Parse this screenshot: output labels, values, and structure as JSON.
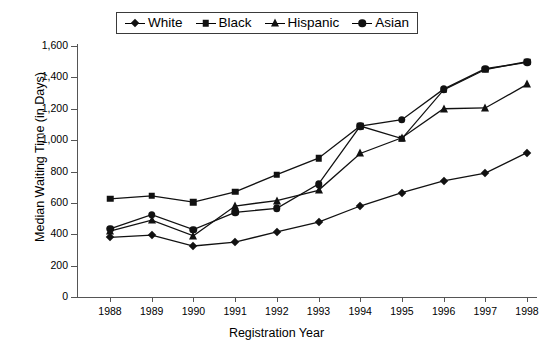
{
  "chart_data": {
    "type": "line",
    "title": "",
    "xlabel": "Registration Year",
    "ylabel": "Median Waiting Time (in Days)",
    "categories": [
      "1988",
      "1989",
      "1990",
      "1991",
      "1992",
      "1993",
      "1994",
      "1995",
      "1996",
      "1997",
      "1998"
    ],
    "x": [
      1988,
      1989,
      1990,
      1991,
      1992,
      1993,
      1994,
      1995,
      1996,
      1997,
      1998
    ],
    "xlim": [
      1987.6,
      1998.4
    ],
    "ylim": [
      0,
      1600
    ],
    "yticks": [
      0,
      200,
      400,
      600,
      800,
      1000,
      1200,
      1400,
      1600
    ],
    "ytick_labels": [
      "0",
      "200",
      "400",
      "600",
      "800",
      "1,000",
      "1,200",
      "1,400",
      "1,600"
    ],
    "grid": false,
    "legend_position": "top-center",
    "series": [
      {
        "name": "White",
        "marker": "diamond",
        "values": [
          380,
          395,
          325,
          350,
          415,
          478,
          580,
          665,
          740,
          790,
          920
        ]
      },
      {
        "name": "Black",
        "marker": "square",
        "values": [
          625,
          645,
          605,
          670,
          780,
          885,
          1090,
          1010,
          1320,
          1450,
          1500
        ]
      },
      {
        "name": "Hispanic",
        "marker": "triangle",
        "values": [
          420,
          490,
          390,
          580,
          615,
          680,
          915,
          1015,
          1200,
          1205,
          1355
        ]
      },
      {
        "name": "Asian",
        "marker": "circle",
        "values": [
          435,
          525,
          430,
          540,
          565,
          720,
          1090,
          1130,
          1325,
          1455,
          1495
        ]
      }
    ]
  },
  "legend": {
    "entries": [
      {
        "label": "White",
        "marker": "diamond"
      },
      {
        "label": "Black",
        "marker": "square"
      },
      {
        "label": "Hispanic",
        "marker": "triangle"
      },
      {
        "label": "Asian",
        "marker": "circle"
      }
    ]
  },
  "colors": {
    "series": "#111111",
    "axis": "#555555",
    "background": "#ffffff"
  }
}
